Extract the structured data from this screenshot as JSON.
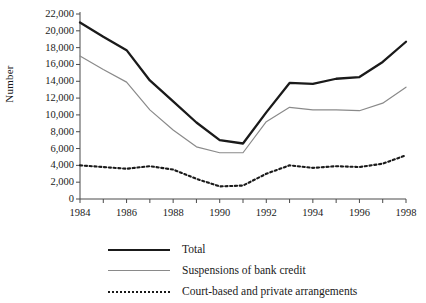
{
  "chart_data": {
    "type": "line",
    "title": "",
    "xlabel": "",
    "ylabel": "Number",
    "xlim": [
      1984,
      1998
    ],
    "ylim": [
      0,
      22000
    ],
    "ytick_step": 2000,
    "yticks": [
      0,
      2000,
      4000,
      6000,
      8000,
      10000,
      12000,
      14000,
      16000,
      18000,
      20000,
      22000
    ],
    "ytick_labels": [
      "0",
      "2,000",
      "4,000",
      "6,000",
      "8,000",
      "10,000",
      "12,000",
      "14,000",
      "16,000",
      "18,000",
      "20,000",
      "22,000"
    ],
    "x": [
      1984,
      1985,
      1986,
      1987,
      1988,
      1989,
      1990,
      1991,
      1992,
      1993,
      1994,
      1995,
      1996,
      1997,
      1998
    ],
    "xticks": [
      1984,
      1985,
      1986,
      1987,
      1988,
      1989,
      1990,
      1991,
      1992,
      1993,
      1994,
      1995,
      1996,
      1997,
      1998
    ],
    "xtick_labels": [
      "1984",
      "",
      "1986",
      "",
      "1988",
      "",
      "1990",
      "",
      "1992",
      "",
      "1994",
      "",
      "1996",
      "",
      "1998"
    ],
    "grid": false,
    "legend_position": "below",
    "series": [
      {
        "name": "Total",
        "style": "solid-thick",
        "color": "#1a1a1a",
        "values": [
          21000,
          19300,
          17700,
          14100,
          11600,
          9100,
          7000,
          6600,
          10300,
          13800,
          13700,
          14300,
          14500,
          16300,
          18700
        ]
      },
      {
        "name": "Suspensions of bank credit",
        "style": "solid-thin",
        "color": "#8a8a8a",
        "values": [
          17000,
          15400,
          13900,
          10600,
          8200,
          6200,
          5500,
          5500,
          9200,
          10900,
          10600,
          10600,
          10500,
          11400,
          13300
        ]
      },
      {
        "name": "Court-based and private arrangements",
        "style": "dotted",
        "color": "#1a1a1a",
        "values": [
          4000,
          3800,
          3600,
          3900,
          3500,
          2400,
          1500,
          1600,
          3000,
          4000,
          3700,
          3900,
          3800,
          4200,
          5200
        ]
      }
    ]
  },
  "legend": {
    "items": [
      {
        "label": "Total"
      },
      {
        "label": "Suspensions of bank credit"
      },
      {
        "label": "Court-based and private arrangements"
      }
    ]
  }
}
